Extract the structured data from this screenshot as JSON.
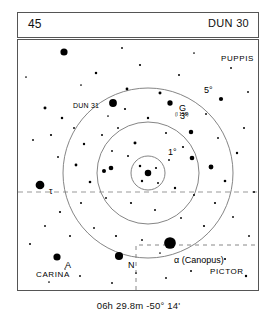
{
  "header": {
    "page_number": "45",
    "chart_id": "DUN 30"
  },
  "caption": {
    "coordinates": "06h 29.8m  -50° 14'"
  },
  "chart_data": {
    "type": "scatter",
    "title": "DUN 30",
    "subtitle": "06h 29.8m  -50° 14'",
    "xlabel": "",
    "ylabel": "",
    "projection": "finder-chart",
    "field_center": {
      "ra": "06h 29.8m",
      "dec": "-50° 14'"
    },
    "xlim": [
      0,
      240
    ],
    "ylim": [
      0,
      250
    ],
    "grid": false,
    "legend_position": "none",
    "rings": [
      {
        "label": "1°",
        "radius_deg": 1,
        "radius_px": 17,
        "cx": 130,
        "cy": 133,
        "label_x": 150,
        "label_y": 108
      },
      {
        "label": "3°",
        "radius_deg": 3,
        "radius_px": 51,
        "cx": 130,
        "cy": 133,
        "label_x": 162,
        "label_y": 72
      },
      {
        "label": "5°",
        "radius_deg": 5,
        "radius_px": 85,
        "cx": 130,
        "cy": 133,
        "label_x": 186,
        "label_y": 46
      }
    ],
    "constellation_labels": [
      {
        "name": "PUPPIS",
        "x": 203,
        "y": 15
      },
      {
        "name": "CARINA",
        "x": 18,
        "y": 231
      },
      {
        "name": "PICTOR",
        "x": 192,
        "y": 228
      }
    ],
    "star_labels": [
      {
        "name": "DUN 31",
        "x": 55,
        "y": 62,
        "style": "small"
      },
      {
        "name": "G",
        "x": 161,
        "y": 64,
        "style": "star"
      },
      {
        "name": "(I 156)",
        "x": 157,
        "y": 73,
        "style": "tiny"
      },
      {
        "name": "τ",
        "x": 31,
        "y": 147,
        "style": "star"
      },
      {
        "name": "N",
        "x": 110,
        "y": 221,
        "style": "star"
      },
      {
        "name": "α (Canopus)",
        "x": 156,
        "y": 216,
        "style": "star"
      },
      {
        "name": "A",
        "x": 47,
        "y": 221,
        "style": "star"
      }
    ],
    "boundaries": [
      {
        "name": "carina-puppis-boundary",
        "type": "dashed-horizontal",
        "y": 152
      },
      {
        "name": "pictor-boundary",
        "type": "dashed-box",
        "x": 118,
        "y": 205,
        "w": 122,
        "h": 45
      }
    ],
    "stars": [
      {
        "x": 130,
        "y": 133,
        "mag": 4.2
      },
      {
        "x": 122,
        "y": 126,
        "mag": 1.6
      },
      {
        "x": 138,
        "y": 128,
        "mag": 1.4
      },
      {
        "x": 124,
        "y": 141,
        "mag": 1.5
      },
      {
        "x": 140,
        "y": 143,
        "mag": 1.3
      },
      {
        "x": 152,
        "y": 203,
        "mag": 7.5
      },
      {
        "x": 101,
        "y": 216,
        "mag": 5.2
      },
      {
        "x": 39,
        "y": 217,
        "mag": 4.6
      },
      {
        "x": 22,
        "y": 145,
        "mag": 5.6
      },
      {
        "x": 95,
        "y": 63,
        "mag": 5.0
      },
      {
        "x": 46,
        "y": 12,
        "mag": 4.6
      },
      {
        "x": 152,
        "y": 63,
        "mag": 3.4
      },
      {
        "x": 117,
        "y": 103,
        "mag": 1.9
      },
      {
        "x": 58,
        "y": 125,
        "mag": 1.8
      },
      {
        "x": 93,
        "y": 128,
        "mag": 3.0
      },
      {
        "x": 86,
        "y": 131,
        "mag": 2.6
      },
      {
        "x": 72,
        "y": 142,
        "mag": 1.7
      },
      {
        "x": 174,
        "y": 118,
        "mag": 3.0
      },
      {
        "x": 193,
        "y": 127,
        "mag": 3.1
      },
      {
        "x": 173,
        "y": 92,
        "mag": 2.9
      },
      {
        "x": 203,
        "y": 59,
        "mag": 2.7
      },
      {
        "x": 142,
        "y": 53,
        "mag": 1.9
      },
      {
        "x": 109,
        "y": 49,
        "mag": 1.8
      },
      {
        "x": 27,
        "y": 68,
        "mag": 1.9
      },
      {
        "x": 44,
        "y": 78,
        "mag": 1.6
      },
      {
        "x": 78,
        "y": 33,
        "mag": 1.6
      },
      {
        "x": 122,
        "y": 25,
        "mag": 1.4
      },
      {
        "x": 161,
        "y": 35,
        "mag": 1.3
      },
      {
        "x": 213,
        "y": 28,
        "mag": 1.2
      },
      {
        "x": 230,
        "y": 52,
        "mag": 1.2
      },
      {
        "x": 8,
        "y": 37,
        "mag": 1.1
      },
      {
        "x": 15,
        "y": 100,
        "mag": 1.2
      },
      {
        "x": 33,
        "y": 95,
        "mag": 1.4
      },
      {
        "x": 56,
        "y": 88,
        "mag": 1.2
      },
      {
        "x": 66,
        "y": 104,
        "mag": 1.5
      },
      {
        "x": 84,
        "y": 95,
        "mag": 1.3
      },
      {
        "x": 100,
        "y": 88,
        "mag": 1.2
      },
      {
        "x": 107,
        "y": 69,
        "mag": 1.4
      },
      {
        "x": 130,
        "y": 78,
        "mag": 1.5
      },
      {
        "x": 148,
        "y": 93,
        "mag": 1.3
      },
      {
        "x": 165,
        "y": 107,
        "mag": 1.4
      },
      {
        "x": 151,
        "y": 120,
        "mag": 1.2
      },
      {
        "x": 110,
        "y": 116,
        "mag": 1.3
      },
      {
        "x": 94,
        "y": 111,
        "mag": 1.2
      },
      {
        "x": 157,
        "y": 148,
        "mag": 1.5
      },
      {
        "x": 176,
        "y": 155,
        "mag": 1.3
      },
      {
        "x": 197,
        "y": 163,
        "mag": 1.4
      },
      {
        "x": 207,
        "y": 141,
        "mag": 1.7
      },
      {
        "x": 219,
        "y": 113,
        "mag": 1.5
      },
      {
        "x": 226,
        "y": 88,
        "mag": 1.3
      },
      {
        "x": 188,
        "y": 74,
        "mag": 1.2
      },
      {
        "x": 215,
        "y": 177,
        "mag": 1.2
      },
      {
        "x": 186,
        "y": 186,
        "mag": 1.4
      },
      {
        "x": 163,
        "y": 178,
        "mag": 1.2
      },
      {
        "x": 137,
        "y": 170,
        "mag": 1.3
      },
      {
        "x": 113,
        "y": 163,
        "mag": 1.4
      },
      {
        "x": 88,
        "y": 158,
        "mag": 1.2
      },
      {
        "x": 63,
        "y": 163,
        "mag": 1.3
      },
      {
        "x": 42,
        "y": 172,
        "mag": 1.4
      },
      {
        "x": 27,
        "y": 186,
        "mag": 1.2
      },
      {
        "x": 52,
        "y": 196,
        "mag": 1.3
      },
      {
        "x": 76,
        "y": 188,
        "mag": 1.2
      },
      {
        "x": 98,
        "y": 196,
        "mag": 1.4
      },
      {
        "x": 124,
        "y": 200,
        "mag": 1.2
      },
      {
        "x": 173,
        "y": 231,
        "mag": 1.3
      },
      {
        "x": 148,
        "y": 238,
        "mag": 1.2
      },
      {
        "x": 207,
        "y": 219,
        "mag": 1.4
      },
      {
        "x": 228,
        "y": 236,
        "mag": 1.5
      },
      {
        "x": 62,
        "y": 236,
        "mag": 1.2
      },
      {
        "x": 31,
        "y": 242,
        "mag": 1.1
      },
      {
        "x": 94,
        "y": 243,
        "mag": 1.2
      },
      {
        "x": 12,
        "y": 204,
        "mag": 1.3
      },
      {
        "x": 231,
        "y": 196,
        "mag": 1.2
      },
      {
        "x": 236,
        "y": 152,
        "mag": 1.3
      },
      {
        "x": 104,
        "y": 8,
        "mag": 1.2
      },
      {
        "x": 176,
        "y": 13,
        "mag": 1.1
      },
      {
        "x": 63,
        "y": 45,
        "mag": 1.1
      },
      {
        "x": 90,
        "y": 76,
        "mag": 1.1
      },
      {
        "x": 200,
        "y": 98,
        "mag": 1.2
      },
      {
        "x": 40,
        "y": 117,
        "mag": 1.2
      },
      {
        "x": 142,
        "y": 213,
        "mag": 1.1
      },
      {
        "x": 118,
        "y": 233,
        "mag": 1.1
      },
      {
        "x": 47,
        "y": 229,
        "mag": 1.0
      }
    ]
  }
}
